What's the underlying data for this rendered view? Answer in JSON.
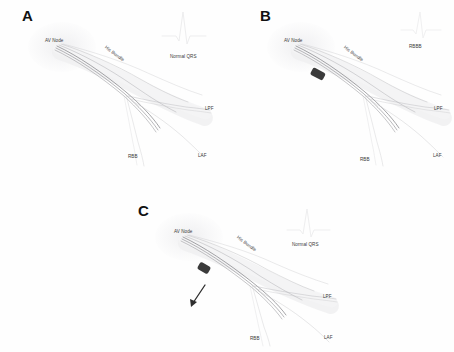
{
  "figure": {
    "type": "cardiac-conduction-system-diagram",
    "background_color": "#ffffff",
    "fiber_color": "#8e8e92",
    "marker_color": "#3b3b3b",
    "label_color": "#3a3a3a"
  },
  "panels": [
    {
      "id": "a",
      "letter": "A",
      "ecg_label": "Normal QRS",
      "has_block_marker": false,
      "has_arrow": false,
      "labels": {
        "av_node": "AV Node",
        "his_bundle": "His Bundle",
        "lpf": "LPF",
        "laf": "LAF",
        "rbb": "RBB"
      }
    },
    {
      "id": "b",
      "letter": "B",
      "ecg_label": "RBBB",
      "has_block_marker": true,
      "has_arrow": false,
      "labels": {
        "av_node": "AV Node",
        "his_bundle": "His Bundle",
        "lpf": "LPF",
        "laf": "LAF",
        "rbb": "RBB"
      }
    },
    {
      "id": "c",
      "letter": "C",
      "ecg_label": "Normal QRS",
      "has_block_marker": true,
      "has_arrow": true,
      "labels": {
        "av_node": "AV Node",
        "his_bundle": "His Bundle",
        "lpf": "LPF",
        "laf": "LAF",
        "rbb": "RBB"
      }
    }
  ]
}
